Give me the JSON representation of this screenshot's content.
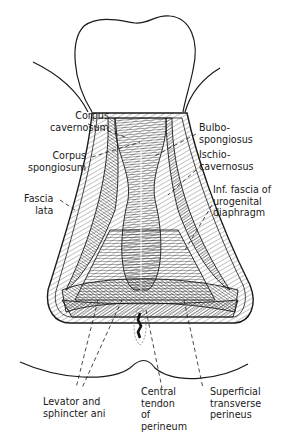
{
  "figure": {
    "colors": {
      "ink": "#1a1a1a",
      "background": "#ffffff",
      "hatch": "#444444"
    }
  },
  "labels": {
    "corpus_cavernosum": "Corpus\ncavernosum",
    "corpus_spongiosum": "Corpus\nspongiosum",
    "fascia_lata": "Fascia\nlata",
    "bulbospongiosus": "Bulbo-\nspongiosus",
    "ischiocavernosus": "Ischio-\ncavernosus",
    "inf_fascia": "Inf. fascia of\nurogenital\ndiaphragm",
    "levator": "Levator and\nsphincter ani",
    "central_tendon": "Central\ntendon\nof\nperineum",
    "superficial_transverse": "Superficial\ntransverse\nperineus"
  }
}
